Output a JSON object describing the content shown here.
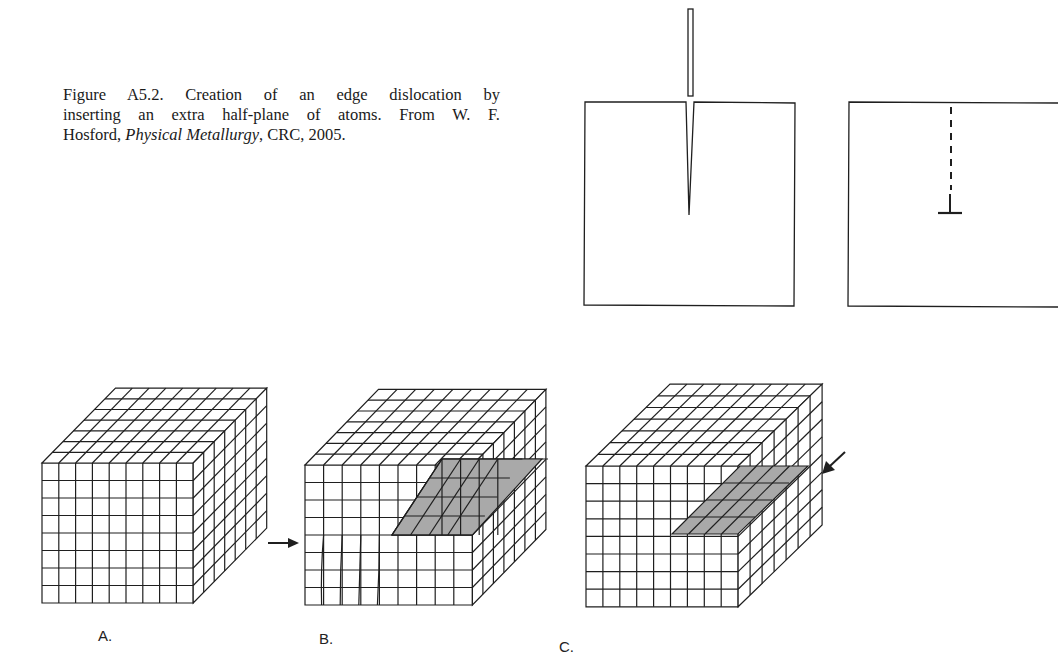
{
  "caption": {
    "line1": "Figure A5.2. Creation of an edge dislocation by",
    "line2": "inserting an extra half-plane of atoms. From W. F.",
    "line3_prefix": "Hosford, ",
    "line3_italic": "Physical Metallurgy",
    "line3_suffix": ", CRC, 2005."
  },
  "panels": {
    "a_label": "A.",
    "b_label": "B.",
    "c_label": "C."
  },
  "colors": {
    "line": "#1f1f1f",
    "shade": "#a9a9a9",
    "background": "#ffffff"
  }
}
